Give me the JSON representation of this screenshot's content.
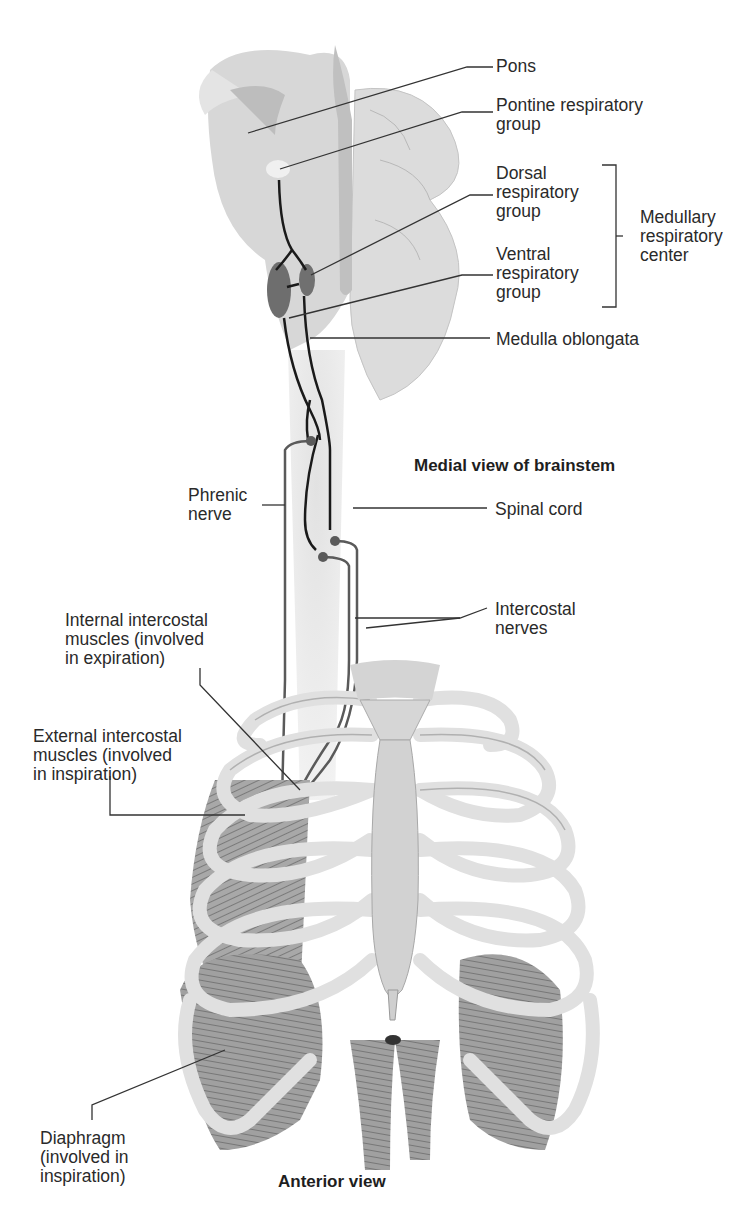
{
  "diagram": {
    "views": {
      "brainstem_title": "Medial view of brainstem",
      "thorax_title": "Anterior view"
    },
    "labels": {
      "pons": "Pons",
      "pontine_group": "Pontine respiratory\ngroup",
      "dorsal_group": "Dorsal\nrespiratory\ngroup",
      "ventral_group": "Ventral\nrespiratory\ngroup",
      "medullary_center": "Medullary\nrespiratory\ncenter",
      "medulla": "Medulla oblongata",
      "phrenic_nerve": "Phrenic\nnerve",
      "spinal_cord": "Spinal cord",
      "intercostal_nerves": "Intercostal\nnerves",
      "internal_intercostal": "Internal intercostal\nmuscles (involved\nin expiration)",
      "external_intercostal": "External intercostal\nmuscles (involved\nin inspiration)",
      "diaphragm": "Diaphragm\n(involved in\ninspiration)"
    },
    "colors": {
      "brain_tissue": "#d9d9d9",
      "nucleus": "#6e6e6e",
      "nerve": "#1a1a1a",
      "bone": "#e2e2e2",
      "muscle": "#9a9a9a",
      "leader_line": "#333333"
    }
  }
}
